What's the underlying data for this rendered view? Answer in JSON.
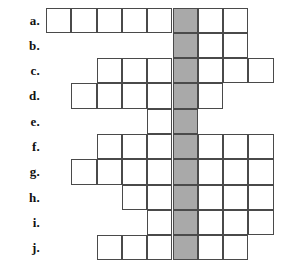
{
  "puzzle": {
    "title": "Crossword Answer Grid",
    "cell_size": 25.3,
    "origin_x": 46,
    "origin_y": 7.5,
    "highlight_column_index": 5,
    "colors": {
      "cell_border": "#4a4a4a",
      "cell_fill": "#ffffff",
      "highlight_fill": "#a9a9a9",
      "label_text": "#111111",
      "page_background": "#ffffff"
    },
    "rows": [
      {
        "label": "a.",
        "start_col": 0,
        "length": 8
      },
      {
        "label": "b.",
        "start_col": 5,
        "length": 3
      },
      {
        "label": "c.",
        "start_col": 2,
        "length": 7
      },
      {
        "label": "d.",
        "start_col": 1,
        "length": 6
      },
      {
        "label": "e.",
        "start_col": 4,
        "length": 2
      },
      {
        "label": "f.",
        "start_col": 2,
        "length": 7
      },
      {
        "label": "g.",
        "start_col": 1,
        "length": 8
      },
      {
        "label": "h.",
        "start_col": 3,
        "length": 6
      },
      {
        "label": "i.",
        "start_col": 4,
        "length": 5
      },
      {
        "label": "j.",
        "start_col": 2,
        "length": 6
      }
    ]
  }
}
